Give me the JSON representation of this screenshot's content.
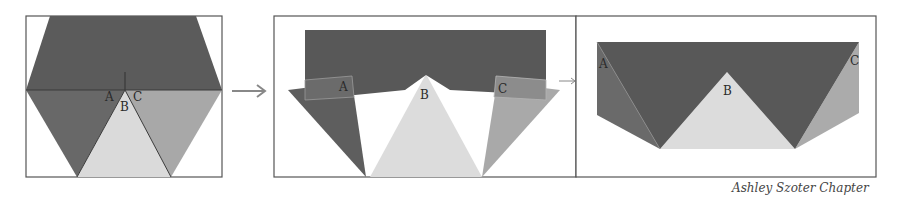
{
  "colors": {
    "dark": "#5b5b5b",
    "medium_dark": "#6a6a6a",
    "medium": "#a9a9a9",
    "light": "#d9d9d9",
    "border": "#555555",
    "background": "#ffffff"
  },
  "panels": [
    {
      "id": "panel-1",
      "description": "Hexagon with top trapezoid and three triangles below",
      "labels": {
        "a": "A",
        "b": "B",
        "c": "C"
      }
    },
    {
      "id": "panel-2",
      "description": "Rectangle with folded triangles A, B, C",
      "labels": {
        "a": "A",
        "b": "B",
        "c": "C"
      }
    },
    {
      "id": "panel-3",
      "description": "Resulting shape with triangles A, B, C",
      "labels": {
        "a": "A",
        "b": "B",
        "c": "C"
      }
    }
  ],
  "arrows": [
    "arrow-right",
    "arrow-right"
  ],
  "signature": "Ashley Szoter Chapter"
}
